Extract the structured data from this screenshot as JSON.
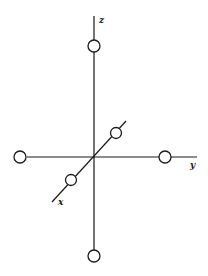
{
  "diagram": {
    "type": "octahedral coordinate axes",
    "colors": {
      "line": "#1a1a1a",
      "background": "#ffffff"
    },
    "origin": {
      "x": 94,
      "y": 157
    },
    "axes": [
      {
        "id": "z",
        "label": "z",
        "from": [
          94,
          16
        ],
        "to": [
          94,
          250
        ],
        "label_pos": [
          99,
          23
        ]
      },
      {
        "id": "y",
        "label": "y",
        "from": [
          27,
          157
        ],
        "to": [
          197,
          157
        ],
        "label_pos": [
          190,
          168
        ]
      },
      {
        "id": "x",
        "label": "x",
        "from": [
          126,
          121
        ],
        "to": [
          52,
          202
        ],
        "label_pos": [
          58,
          205
        ]
      }
    ],
    "atoms": [
      {
        "id": "z-plus",
        "axis": "z",
        "cx": 94,
        "cy": 46,
        "r": 6
      },
      {
        "id": "z-minus",
        "axis": "z",
        "cx": 94,
        "cy": 256,
        "r": 6
      },
      {
        "id": "y-minus",
        "axis": "y",
        "cx": 20,
        "cy": 157,
        "r": 6
      },
      {
        "id": "y-plus",
        "axis": "y",
        "cx": 165,
        "cy": 157,
        "r": 6
      },
      {
        "id": "x-minus",
        "axis": "x",
        "cx": 116,
        "cy": 133,
        "r": 5.5
      },
      {
        "id": "x-plus",
        "axis": "x",
        "cx": 71,
        "cy": 180,
        "r": 5.5
      }
    ]
  }
}
